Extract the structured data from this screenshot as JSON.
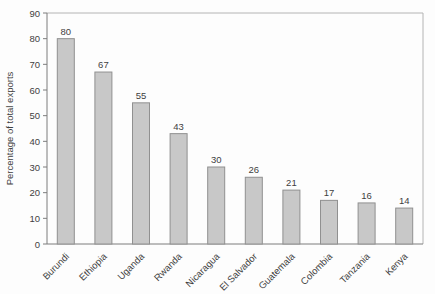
{
  "chart_data": {
    "type": "bar",
    "title": "",
    "xlabel": "",
    "ylabel": "Percentage of total exports",
    "categories": [
      "Burundi",
      "Ethiopia",
      "Uganda",
      "Rwanda",
      "Nicaragua",
      "El Salvador",
      "Guatemala",
      "Colombia",
      "Tanzania",
      "Kenya"
    ],
    "values": [
      80,
      67,
      55,
      43,
      30,
      26,
      21,
      17,
      16,
      14
    ],
    "value_labels_shown": true,
    "ylim": [
      0,
      90
    ],
    "yticks": [
      0,
      10,
      20,
      30,
      40,
      50,
      60,
      70,
      80,
      90
    ],
    "grid": false,
    "legend": false,
    "category_label_rotation_deg": -45,
    "colors": {
      "bar_fill": "#c8c8c8",
      "bar_stroke": "#909090",
      "axis": "#7d7d7d",
      "frame": "#b4b4b4",
      "text": "#3f3f3f",
      "background": "#fdfdfd"
    }
  }
}
